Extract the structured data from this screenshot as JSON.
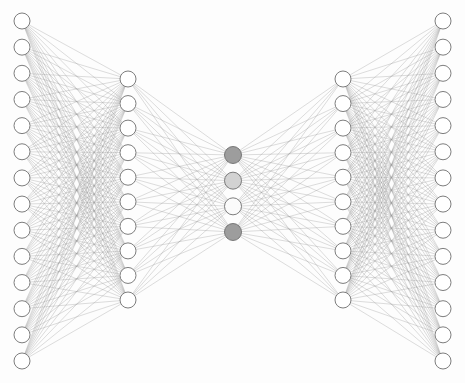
{
  "figure": {
    "title": "",
    "type": "neural-network-architecture",
    "background_color": "#fdfdfd",
    "canvas": {
      "width": 465,
      "height": 383
    }
  },
  "style": {
    "edge_color": "#9a9a9a",
    "edge_width": 0.45,
    "edge_opacity": 0.75,
    "node_stroke": "#6e6e6e",
    "node_stroke_width": 0.9,
    "node_radius": 8,
    "bottleneck_node_radius": 8.5
  },
  "network": {
    "layer_count": 5,
    "layers": [
      {
        "name": "input-layer",
        "label": "Input",
        "index": 0,
        "node_count": 14,
        "x": 22,
        "y_start": 21,
        "y_end": 361,
        "default_fill": "#ffffff",
        "node_fills": [
          "#ffffff",
          "#ffffff",
          "#ffffff",
          "#ffffff",
          "#ffffff",
          "#ffffff",
          "#ffffff",
          "#ffffff",
          "#ffffff",
          "#ffffff",
          "#ffffff",
          "#ffffff",
          "#ffffff",
          "#ffffff"
        ]
      },
      {
        "name": "hidden-layer-1",
        "label": "Hidden 1",
        "index": 1,
        "node_count": 10,
        "x": 128,
        "y_start": 79,
        "y_end": 300,
        "default_fill": "#ffffff",
        "node_fills": [
          "#ffffff",
          "#ffffff",
          "#ffffff",
          "#ffffff",
          "#ffffff",
          "#ffffff",
          "#ffffff",
          "#ffffff",
          "#ffffff",
          "#ffffff"
        ]
      },
      {
        "name": "bottleneck-layer",
        "label": "Bottleneck",
        "index": 2,
        "node_count": 4,
        "x": 233,
        "y_start": 155,
        "y_end": 232,
        "default_fill": "#ffffff",
        "node_fills": [
          "#9d9d9d",
          "#d2d2d2",
          "#fbfbfb",
          "#9d9d9d"
        ]
      },
      {
        "name": "hidden-layer-2",
        "label": "Hidden 2",
        "index": 3,
        "node_count": 10,
        "x": 343,
        "y_start": 79,
        "y_end": 300,
        "default_fill": "#ffffff",
        "node_fills": [
          "#ffffff",
          "#ffffff",
          "#ffffff",
          "#ffffff",
          "#ffffff",
          "#ffffff",
          "#ffffff",
          "#ffffff",
          "#ffffff",
          "#ffffff"
        ]
      },
      {
        "name": "output-layer",
        "label": "Output",
        "index": 4,
        "node_count": 14,
        "x": 443,
        "y_start": 21,
        "y_end": 361,
        "default_fill": "#ffffff",
        "node_fills": [
          "#ffffff",
          "#ffffff",
          "#ffffff",
          "#ffffff",
          "#ffffff",
          "#ffffff",
          "#ffffff",
          "#ffffff",
          "#ffffff",
          "#ffffff",
          "#ffffff",
          "#ffffff",
          "#ffffff",
          "#ffffff"
        ]
      }
    ],
    "connections": [
      {
        "from": 0,
        "to": 1,
        "type": "fully-connected",
        "edge_count": 140
      },
      {
        "from": 1,
        "to": 2,
        "type": "fully-connected",
        "edge_count": 40
      },
      {
        "from": 2,
        "to": 3,
        "type": "fully-connected",
        "edge_count": 40
      },
      {
        "from": 3,
        "to": 4,
        "type": "fully-connected",
        "edge_count": 140
      }
    ],
    "total_nodes": 52,
    "total_edges": 360
  }
}
